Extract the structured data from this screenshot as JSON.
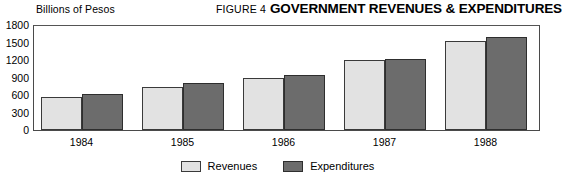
{
  "header": {
    "axis_unit_label": "Billions of Pesos",
    "figure_number": "FIGURE 4",
    "title": "GOVERNMENT REVENUES & EXPENDITURES"
  },
  "colors": {
    "revenues_fill": "#e2e2e2",
    "expenditures_fill": "#6c6c6c",
    "bar_border": "#3a3a3a",
    "frame_border": "#4a4a4a",
    "background": "#ffffff",
    "text": "#000000"
  },
  "legend": {
    "position": "bottom-center",
    "entries": [
      {
        "label": "Revenues",
        "swatch": "revenues"
      },
      {
        "label": "Expenditures",
        "swatch": "expenditures"
      }
    ]
  },
  "chart_data": {
    "type": "bar",
    "title": "GOVERNMENT REVENUES & EXPENDITURES",
    "subtitle": "FIGURE 4",
    "xlabel": "",
    "ylabel": "Billions of Pesos",
    "categories": [
      "1984",
      "1985",
      "1986",
      "1987",
      "1988"
    ],
    "series": [
      {
        "name": "Revenues",
        "values": [
          560,
          740,
          900,
          1200,
          1530
        ]
      },
      {
        "name": "Expenditures",
        "values": [
          620,
          800,
          950,
          1210,
          1600
        ]
      }
    ],
    "ylim": [
      0,
      1800
    ],
    "yticks": [
      0,
      300,
      600,
      900,
      1200,
      1500,
      1800
    ],
    "ytick_labels": [
      "0",
      "300",
      "600",
      "900",
      "1200",
      "1500",
      "1800"
    ],
    "grid": false,
    "legend_position": "bottom-center"
  }
}
